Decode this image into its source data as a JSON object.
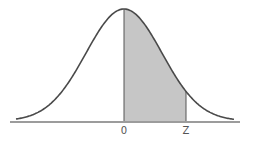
{
  "diagram": {
    "type": "standard-normal-curve",
    "shaded_region": {
      "from_label": "0",
      "to_label": "Z"
    },
    "axis_labels": [
      {
        "text": "0",
        "x": 124
      },
      {
        "text": "Z",
        "x": 186
      }
    ],
    "colors": {
      "curve": "#4a4a4a",
      "shade": "#c6c6c6",
      "axis": "#3a3a3a",
      "label": "#555555"
    }
  }
}
